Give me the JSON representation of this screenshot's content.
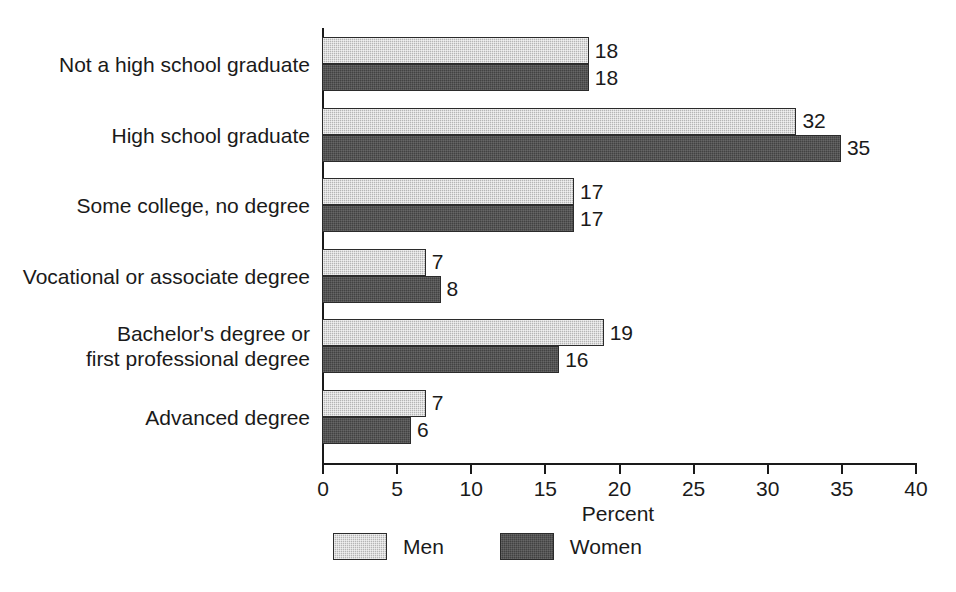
{
  "chart_data": {
    "type": "bar",
    "orientation": "horizontal",
    "title": "",
    "subtitle": "",
    "xlabel": "Percent",
    "ylabel": "",
    "xlim": [
      0,
      40
    ],
    "xticks": [
      0,
      5,
      10,
      15,
      20,
      25,
      30,
      35,
      40
    ],
    "xtick_labels": [
      "0",
      "5",
      "10",
      "15",
      "20",
      "25",
      "30",
      "35",
      "40"
    ],
    "grid": false,
    "legend_position": "bottom",
    "categories": [
      "Not a high school graduate",
      "High school graduate",
      "Some college, no degree",
      "Vocational or associate degree",
      "Bachelor's degree or\nfirst professional degree",
      "Advanced degree"
    ],
    "series": [
      {
        "name": "Men",
        "color": "#b5b5b5",
        "pattern": "stipple",
        "values": [
          18,
          32,
          17,
          7,
          19,
          7
        ],
        "value_labels": [
          "18",
          "32",
          "17",
          "7",
          "19",
          "7"
        ]
      },
      {
        "name": "Women",
        "color": "#424242",
        "pattern": "solid-dark",
        "values": [
          18,
          35,
          17,
          8,
          16,
          6
        ],
        "value_labels": [
          "18",
          "35",
          "17",
          "8",
          "16",
          "6"
        ]
      }
    ]
  },
  "legend": {
    "items": [
      {
        "label": "Men"
      },
      {
        "label": "Women"
      }
    ]
  },
  "axis": {
    "x_title": "Percent"
  }
}
